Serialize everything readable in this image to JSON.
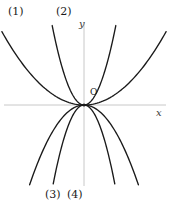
{
  "figure": {
    "background_color": "#ffffff",
    "curve_color": "#1a1a1a",
    "axis_color": "#c8c8c8",
    "width": 170,
    "height": 212
  },
  "axes": {
    "x_label": "x",
    "y_label": "y",
    "origin_label": "O",
    "origin_px": {
      "x": 84,
      "y": 105
    },
    "x_axis_line": {
      "x1": 4,
      "y1": 105,
      "x2": 166,
      "y2": 105
    },
    "y_axis_line": {
      "x1": 84,
      "y1": 22,
      "x2": 84,
      "y2": 186
    }
  },
  "labels": {
    "curve_1": "(1)",
    "curve_2": "(2)",
    "curve_3": "(3)",
    "curve_4": "(4)"
  },
  "chart_data": {
    "type": "line",
    "title": "",
    "xlabel": "x",
    "ylabel": "y",
    "grid": false,
    "legend": "inline-curve-labels",
    "xlim": [
      -80,
      82
    ],
    "ylim": [
      -81,
      83
    ],
    "annotations": [
      {
        "text": "O",
        "x": 6,
        "y": 8,
        "role": "origin-marker"
      },
      {
        "text": "(1)",
        "x": -74,
        "y": 92,
        "role": "curve-label"
      },
      {
        "text": "(2)",
        "x": -26,
        "y": 92,
        "role": "curve-label"
      },
      {
        "text": "(3)",
        "x": -37,
        "y": -87,
        "role": "curve-label"
      },
      {
        "text": "(4)",
        "x": -15,
        "y": -87,
        "role": "curve-label"
      }
    ],
    "series": [
      {
        "name": "(1)",
        "equation": "y = a1 * x^2",
        "opening": "upward",
        "width": "wide",
        "coefficient": 0.0115,
        "x": [
          -80,
          -70,
          -60,
          -50,
          -40,
          -30,
          -20,
          -10,
          0,
          10,
          20,
          30,
          40,
          50,
          60,
          70,
          80
        ],
        "values": [
          73.6,
          56.4,
          41.4,
          28.8,
          18.4,
          10.4,
          4.6,
          1.2,
          0,
          1.2,
          4.6,
          10.4,
          18.4,
          28.8,
          41.4,
          56.4,
          73.6
        ]
      },
      {
        "name": "(2)",
        "equation": "y = a2 * x^2",
        "opening": "upward",
        "width": "narrow",
        "coefficient": 0.083,
        "x": [
          -31,
          -27,
          -23,
          -19,
          -15,
          -11,
          -7,
          -3,
          0,
          3,
          7,
          11,
          15,
          19,
          23,
          27,
          31
        ],
        "values": [
          79.8,
          60.5,
          43.9,
          30.0,
          18.7,
          10.0,
          4.1,
          0.7,
          0,
          0.7,
          4.1,
          10.0,
          18.7,
          30.0,
          43.9,
          60.5,
          79.8
        ]
      },
      {
        "name": "(3)",
        "equation": "y = -a3 * x^2",
        "opening": "downward",
        "width": "wide",
        "coefficient": -0.0285,
        "x": [
          -53,
          -46,
          -40,
          -33,
          -26,
          -20,
          -13,
          -6,
          0,
          6,
          13,
          20,
          26,
          33,
          40,
          46,
          53
        ],
        "values": [
          -80.1,
          -60.3,
          -45.6,
          -31.0,
          -19.3,
          -11.4,
          -4.8,
          -1.0,
          0,
          -1.0,
          -4.8,
          -11.4,
          -19.3,
          -31.0,
          -45.6,
          -60.3,
          -80.1
        ]
      },
      {
        "name": "(4)",
        "equation": "y = -a4 * x^2",
        "opening": "downward",
        "width": "narrow",
        "coefficient": -0.088,
        "x": [
          -30,
          -26,
          -22,
          -19,
          -15,
          -11,
          -7,
          -3,
          0,
          3,
          7,
          11,
          15,
          19,
          22,
          26,
          30
        ],
        "values": [
          -79.2,
          -59.5,
          -42.6,
          -31.8,
          -19.8,
          -10.6,
          -4.3,
          -0.8,
          0,
          -0.8,
          -4.3,
          -10.6,
          -19.8,
          -31.8,
          -42.6,
          -59.5,
          -79.2
        ]
      }
    ]
  }
}
